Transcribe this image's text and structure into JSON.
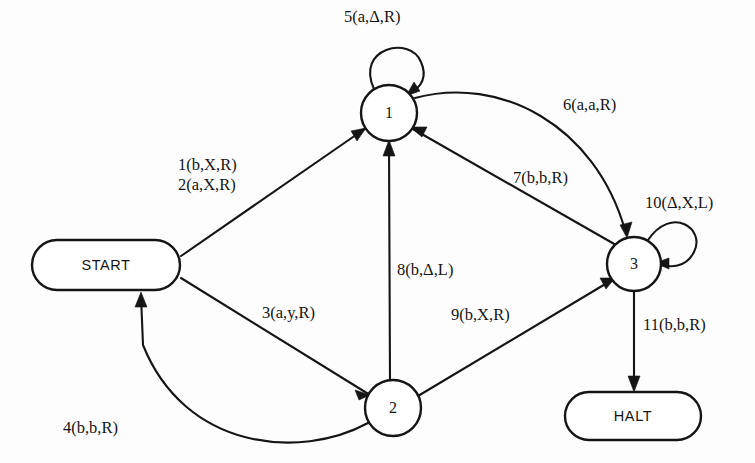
{
  "diagram": {
    "type": "turing-machine-state-diagram",
    "nodes": [
      {
        "id": "start",
        "label": "START",
        "shape": "stadium",
        "cx": 106,
        "cy": 265,
        "rx": 74,
        "ry": 25
      },
      {
        "id": "s1",
        "label": "1",
        "shape": "circle",
        "cx": 389,
        "cy": 113,
        "r": 28
      },
      {
        "id": "s2",
        "label": "2",
        "shape": "circle",
        "cx": 393,
        "cy": 408,
        "r": 28
      },
      {
        "id": "s3",
        "label": "3",
        "shape": "circle",
        "cx": 634,
        "cy": 264,
        "r": 27
      },
      {
        "id": "halt",
        "label": "HALT",
        "shape": "stadium",
        "cx": 633,
        "cy": 416,
        "rx": 68,
        "ry": 24
      }
    ],
    "edges": [
      {
        "id": "e1",
        "from": "start",
        "to": "s1",
        "label": "1(b,X,R)",
        "label_x": 178,
        "label_y": 170
      },
      {
        "id": "e2",
        "from": "start",
        "to": "s1",
        "label": "2(a,X,R)",
        "label_x": 178,
        "label_y": 190
      },
      {
        "id": "e3",
        "from": "start",
        "to": "s2",
        "label": "3(a,y,R)",
        "label_x": 262,
        "label_y": 318
      },
      {
        "id": "e4",
        "from": "s2",
        "to": "start",
        "label": "4(b,b,R)",
        "label_x": 63,
        "label_y": 433
      },
      {
        "id": "e5",
        "from": "s1",
        "to": "s1",
        "label": "5(a,Δ,R)",
        "label_x": 344,
        "label_y": 22
      },
      {
        "id": "e6",
        "from": "s1",
        "to": "s3",
        "label": "6(a,a,R)",
        "label_x": 563,
        "label_y": 110
      },
      {
        "id": "e7",
        "from": "s3",
        "to": "s1",
        "label": "7(b,b,R)",
        "label_x": 513,
        "label_y": 183
      },
      {
        "id": "e8",
        "from": "s2",
        "to": "s1",
        "label": "8(b,Δ,L)",
        "label_x": 397,
        "label_y": 275
      },
      {
        "id": "e9",
        "from": "s2",
        "to": "s3",
        "label": "9(b,X,R)",
        "label_x": 451,
        "label_y": 320
      },
      {
        "id": "e10",
        "from": "s3",
        "to": "s3",
        "label": "10(Δ,X,L)",
        "label_x": 645,
        "label_y": 208
      },
      {
        "id": "e11",
        "from": "s3",
        "to": "halt",
        "label": "11(b,b,R)",
        "label_x": 643,
        "label_y": 330
      }
    ],
    "colors": {
      "stroke": "#151515",
      "background": "#fdfdfd",
      "node_fill": "#ffffff"
    }
  }
}
